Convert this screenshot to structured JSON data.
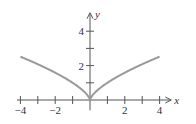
{
  "chart_data": {
    "type": "line",
    "title": "",
    "function": "y = x^(2/3)",
    "xlabel": "x",
    "ylabel": "y",
    "xlim": [
      -4.2,
      4.5
    ],
    "ylim": [
      -0.6,
      4.9
    ],
    "x_ticks": [
      -4,
      -3,
      -2,
      -1,
      1,
      2,
      3,
      4
    ],
    "x_tick_labels": [
      "-4",
      "-2",
      "2",
      "4"
    ],
    "x_tick_label_values": [
      -4,
      -2,
      2,
      4
    ],
    "y_ticks": [
      1,
      2,
      3,
      4
    ],
    "y_tick_labels": [
      "2",
      "4"
    ],
    "y_tick_label_values": [
      2,
      4
    ],
    "series": [
      {
        "name": "y = x^(2/3)",
        "color": "#999999",
        "x": [
          -4,
          -3,
          -2,
          -1,
          -0.5,
          -0.1,
          0,
          0.1,
          0.5,
          1,
          2,
          3,
          4
        ],
        "y": [
          2.52,
          2.08,
          1.59,
          1.0,
          0.63,
          0.22,
          0,
          0.22,
          0.63,
          1.0,
          1.59,
          2.08,
          2.52
        ]
      }
    ],
    "grid": false,
    "legend": null
  },
  "colors": {
    "axis": "#555555",
    "curve": "#999999"
  }
}
